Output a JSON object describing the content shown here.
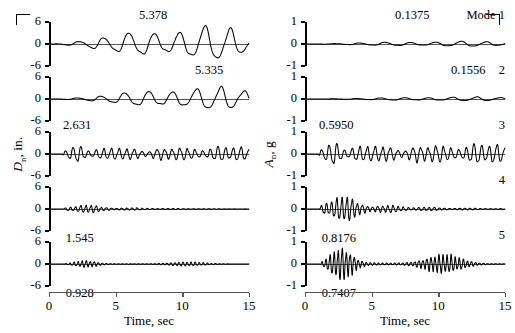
{
  "figure": {
    "x_axis": {
      "title": "Time, sec",
      "ticks": [
        0,
        5,
        10,
        15
      ],
      "tick_labels": [
        "0",
        "5",
        "10",
        "15"
      ],
      "min": 0,
      "max": 15
    },
    "corner_marks": [
      "top-left",
      "top-right"
    ]
  },
  "chart_data": {
    "type": "line",
    "title": "",
    "xlabel": "Time, sec",
    "xlim": [
      0,
      15
    ],
    "grid": false,
    "legend": "none",
    "panels": [
      {
        "column": "left",
        "mode": 1,
        "ylabel": "D_n, in.",
        "ylim": [
          -6,
          6
        ],
        "yticks": [
          6,
          0,
          -6
        ],
        "ytick_labels": [
          "6",
          "0",
          "-6"
        ],
        "peak_value": "5.378",
        "peak_time": 8.1,
        "peak_label_position": "above",
        "mode_label": "",
        "freq_hz": 0.53,
        "env": "grow-sustain",
        "amp": 5.378
      },
      {
        "column": "left",
        "mode": 2,
        "ylabel": "",
        "ylim": [
          -6,
          6
        ],
        "yticks": [
          6,
          0,
          -6
        ],
        "ytick_labels": [
          "6",
          "0",
          "-6"
        ],
        "peak_value": "5.335",
        "peak_time": 12.3,
        "peak_label_position": "above",
        "mode_label": "",
        "freq_hz": 0.56,
        "env": "grow-late",
        "amp": 5.335
      },
      {
        "column": "left",
        "mode": 3,
        "ylabel": "D_n, in.",
        "ylim": [
          -6,
          6
        ],
        "yticks": [
          6,
          0,
          -6
        ],
        "ytick_labels": [
          "6",
          "0",
          "-6"
        ],
        "peak_value": "2.631",
        "peak_time": 2.4,
        "peak_label_position": "above",
        "mode_label": "",
        "freq_hz": 1.75,
        "env": "early-peak-sustain",
        "amp": 2.631
      },
      {
        "column": "left",
        "mode": 4,
        "ylabel": "",
        "ylim": [
          -6,
          6
        ],
        "yticks": [
          6,
          0,
          -6
        ],
        "ytick_labels": [
          "6",
          "0",
          "-6"
        ],
        "peak_value": "1.545",
        "peak_time": 2.6,
        "peak_label_position": "below",
        "mode_label": "",
        "freq_hz": 2.6,
        "env": "decay",
        "amp": 1.545
      },
      {
        "column": "left",
        "mode": 5,
        "ylabel": "",
        "ylim": [
          -6,
          6
        ],
        "yticks": [
          6,
          0,
          -6
        ],
        "ytick_labels": [
          "6",
          "0",
          "-6"
        ],
        "peak_value": "0.928",
        "peak_time": 2.6,
        "peak_label_position": "below",
        "mode_label": "",
        "freq_hz": 3.3,
        "env": "decay-burst",
        "amp": 0.928
      },
      {
        "column": "right",
        "mode": 1,
        "ylabel": "A_n, g",
        "ylim": [
          -1,
          1
        ],
        "yticks": [
          1,
          0,
          -1
        ],
        "ytick_labels": [
          "1",
          "0",
          "-1"
        ],
        "peak_value": "0.1375",
        "peak_time": 8.1,
        "peak_label_position": "above",
        "mode_label": "Mode 1",
        "freq_hz": 0.53,
        "env": "grow-sustain",
        "amp": 0.1375
      },
      {
        "column": "right",
        "mode": 2,
        "ylabel": "",
        "ylim": [
          -1,
          1
        ],
        "yticks": [
          1,
          0,
          -1
        ],
        "ytick_labels": [
          "1",
          "0",
          "-1"
        ],
        "peak_value": "0.1556",
        "peak_time": 12.3,
        "peak_label_position": "above",
        "mode_label": "2",
        "freq_hz": 0.56,
        "env": "grow-late",
        "amp": 0.1556
      },
      {
        "column": "right",
        "mode": 3,
        "ylabel": "A_n, g",
        "ylim": [
          -1,
          1
        ],
        "yticks": [
          1,
          0,
          -1
        ],
        "ytick_labels": [
          "1",
          "0",
          "-1"
        ],
        "peak_value": "0.5950",
        "peak_time": 2.4,
        "peak_label_position": "above",
        "mode_label": "3",
        "freq_hz": 1.75,
        "env": "early-peak-sustain",
        "amp": 0.595
      },
      {
        "column": "right",
        "mode": 4,
        "ylabel": "",
        "ylim": [
          -1,
          1
        ],
        "yticks": [
          1,
          0,
          -1
        ],
        "ytick_labels": [
          "1",
          "0",
          "-1"
        ],
        "peak_value": "0.8176",
        "peak_time": 2.6,
        "peak_label_position": "below",
        "mode_label": "4",
        "freq_hz": 2.6,
        "env": "decay",
        "amp": 0.8176
      },
      {
        "column": "right",
        "mode": 5,
        "ylabel": "",
        "ylim": [
          -1,
          1
        ],
        "yticks": [
          1,
          0,
          -1
        ],
        "ytick_labels": [
          "1",
          "0",
          "-1"
        ],
        "peak_value": "0.7407",
        "peak_time": 2.6,
        "peak_label_position": "below",
        "mode_label": "5",
        "freq_hz": 3.3,
        "env": "decay-burst",
        "amp": 0.7407
      }
    ],
    "axis_titles": {
      "left": "Dn, in.",
      "right": "An, g"
    }
  }
}
